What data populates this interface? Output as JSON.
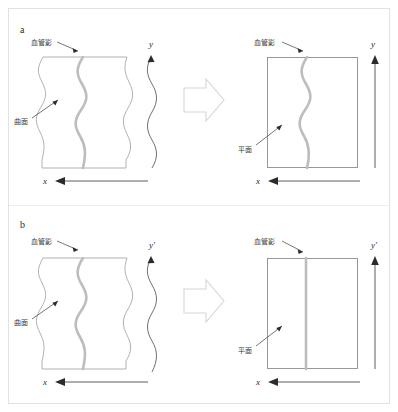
{
  "figure": {
    "caption_panels": [
      "a",
      "b"
    ],
    "background_color": "#ffffff",
    "frame_color": "#e2e2e2",
    "vessel_color": "#bdbdbd",
    "surface_outline_color": "#a8a8a8",
    "axis_color": "#4a4a4a",
    "big_arrow_fill": "#ffffff",
    "big_arrow_stroke": "#d6d6d6"
  },
  "labels": {
    "vessel_shadow": "血管影",
    "curved_surface": "曲面",
    "plane": "平面",
    "panel_a": "a",
    "panel_b": "b",
    "axis_x": "x",
    "axis_y": "y",
    "axis_y_prime": "y'"
  },
  "panel_a": {
    "id": "a",
    "label": "a",
    "left": {
      "title_label": "血管影",
      "surface_label": "曲面",
      "shape": "wavy-curved-surface",
      "vessel_shape": "wavy",
      "x_axis": {
        "label": "x",
        "direction": "left",
        "style": "straight"
      },
      "y_axis": {
        "label": "y",
        "direction": "up",
        "style": "wavy"
      }
    },
    "right": {
      "title_label": "血管影",
      "surface_label": "平面",
      "shape": "rectangle-plane",
      "vessel_shape": "wavy",
      "x_axis": {
        "label": "x",
        "direction": "left",
        "style": "straight"
      },
      "y_axis": {
        "label": "y",
        "direction": "up",
        "style": "straight"
      }
    },
    "transform_arrow": "right-arrow"
  },
  "panel_b": {
    "id": "b",
    "label": "b",
    "left": {
      "title_label": "血管影",
      "surface_label": "曲面",
      "shape": "wavy-curved-surface",
      "vessel_shape": "wavy",
      "x_axis": {
        "label": "x",
        "direction": "left",
        "style": "straight"
      },
      "y_axis": {
        "label": "y'",
        "direction": "up",
        "style": "wavy"
      }
    },
    "right": {
      "title_label": "血管影",
      "surface_label": "平面",
      "shape": "rectangle-plane",
      "vessel_shape": "straight",
      "x_axis": {
        "label": "x",
        "direction": "left",
        "style": "straight"
      },
      "y_axis": {
        "label": "y'",
        "direction": "up",
        "style": "straight"
      }
    },
    "transform_arrow": "right-arrow"
  }
}
